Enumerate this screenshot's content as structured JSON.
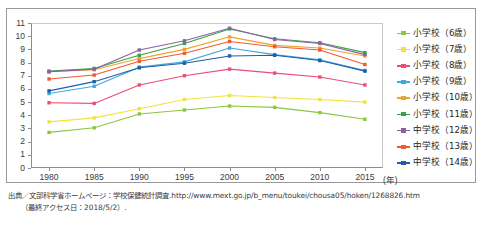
{
  "figure": {
    "y_axis_ticks": [
      "0",
      "1",
      "2",
      "3",
      "4",
      "5",
      "6",
      "7",
      "8",
      "9",
      "10",
      "11"
    ],
    "x_axis_ticks": [
      "1980",
      "1985",
      "1990",
      "1995",
      "2000",
      "2005",
      "2010",
      "2015"
    ],
    "x_axis_unit": "(年)"
  },
  "legend": {
    "items": [
      {
        "label": "小学校（6歳）",
        "color": "#8cc63f"
      },
      {
        "label": "小学校（7歳）",
        "color": "#f2e33c"
      },
      {
        "label": "小学校（8歳）",
        "color": "#ec4d72"
      },
      {
        "label": "小学校（9歳）",
        "color": "#3fa9dd"
      },
      {
        "label": "小学校（10歳）",
        "color": "#f0a32a"
      },
      {
        "label": "小学校（11歳）",
        "color": "#3aa14a"
      },
      {
        "label": "中学校（12歳）",
        "color": "#8e5fa4"
      },
      {
        "label": "中学校（13歳）",
        "color": "#ef5a35"
      },
      {
        "label": "中学校（14歳）",
        "color": "#1f5fa8"
      }
    ]
  },
  "source": {
    "line1_prefix": "出典／文部科学省ホームページ：学校保健統計調査.",
    "line1_url": "http://www.mext.go.jp/b_menu/toukei/chousa05/hoken/1268826.htm",
    "line2": "（最終アクセス日：2018/5/2）."
  },
  "chart_data": {
    "type": "line",
    "title": "",
    "xlabel": "(年)",
    "ylabel": "",
    "grid": false,
    "legend_position": "right",
    "markers": true,
    "x": [
      1980,
      1985,
      1990,
      1995,
      2000,
      2005,
      2010,
      2015
    ],
    "categories": [
      "1980",
      "1985",
      "1990",
      "1995",
      "2000",
      "2005",
      "2010",
      "2015"
    ],
    "xlim": [
      1978,
      2017
    ],
    "ylim": [
      0,
      11
    ],
    "yticks": [
      0,
      1,
      2,
      3,
      4,
      5,
      6,
      7,
      8,
      9,
      10,
      11
    ],
    "series": [
      {
        "name": "小学校（6歳）",
        "color": "#8cc63f",
        "values": [
          2.7,
          3.05,
          4.1,
          4.4,
          4.7,
          4.6,
          4.2,
          3.7
        ]
      },
      {
        "name": "小学校（7歳）",
        "color": "#f2e33c",
        "values": [
          3.5,
          3.8,
          4.5,
          5.2,
          5.5,
          5.35,
          5.2,
          5.0
        ]
      },
      {
        "name": "小学校（8歳）",
        "color": "#ec4d72",
        "values": [
          4.95,
          4.9,
          6.3,
          7.0,
          7.5,
          7.2,
          6.9,
          6.3
        ]
      },
      {
        "name": "小学校（9歳）",
        "color": "#3fa9dd",
        "values": [
          5.65,
          6.2,
          7.65,
          8.05,
          9.1,
          8.6,
          8.2,
          7.4
        ]
      },
      {
        "name": "小学校（10歳）",
        "color": "#f0a32a",
        "values": [
          7.3,
          7.45,
          8.3,
          9.0,
          9.95,
          9.3,
          9.1,
          8.5
        ]
      },
      {
        "name": "小学校（11歳）",
        "color": "#3aa14a",
        "values": [
          7.35,
          7.55,
          8.55,
          9.45,
          10.55,
          9.8,
          9.5,
          8.75
        ]
      },
      {
        "name": "中学校（12歳）",
        "color": "#8e5fa4",
        "values": [
          7.3,
          7.5,
          8.95,
          9.65,
          10.6,
          9.75,
          9.45,
          8.6
        ]
      },
      {
        "name": "中学校（13歳）",
        "color": "#ef5a35",
        "values": [
          6.75,
          7.05,
          8.1,
          8.7,
          9.6,
          9.2,
          8.95,
          7.85
        ]
      },
      {
        "name": "中学校（14歳）",
        "color": "#1f5fa8",
        "values": [
          5.85,
          6.55,
          7.6,
          7.95,
          8.5,
          8.55,
          8.15,
          7.35
        ]
      }
    ]
  }
}
